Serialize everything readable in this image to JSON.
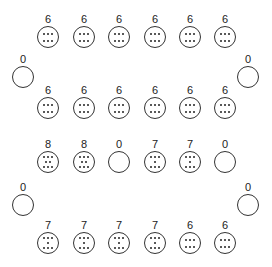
{
  "boards": [
    {
      "name": "board-before",
      "top_row": [
        6,
        6,
        6,
        6,
        6,
        6
      ],
      "bottom_row": [
        6,
        6,
        6,
        6,
        6,
        6
      ],
      "left_store": 0,
      "right_store": 0
    },
    {
      "name": "board-after",
      "top_row": [
        8,
        8,
        0,
        7,
        7,
        0
      ],
      "bottom_row": [
        7,
        7,
        7,
        7,
        6,
        6
      ],
      "left_store": 0,
      "right_store": 0
    }
  ],
  "colors": {
    "outline": "#333333",
    "seed": "#222222",
    "background": "#ffffff"
  }
}
